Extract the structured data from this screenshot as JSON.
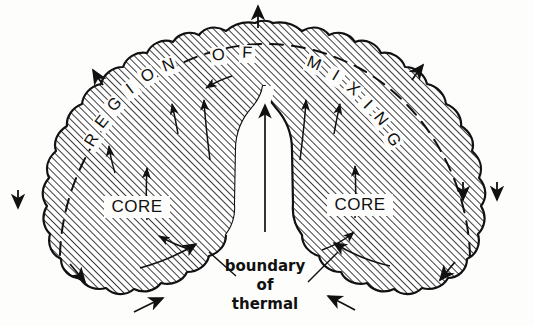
{
  "figure": {
    "kind": "scientific-line-diagram",
    "background_color": "#fdfdfb",
    "ink_color": "#111111",
    "hatch_color": "#1a1a1a"
  },
  "arc_label": {
    "full_text": "REGION OF MIXING",
    "letters": [
      {
        "ch": "R",
        "x": 96,
        "y": 143,
        "rot": -58
      },
      {
        "ch": "E",
        "x": 106,
        "y": 125,
        "rot": -52
      },
      {
        "ch": "G",
        "x": 118,
        "y": 108,
        "rot": -45
      },
      {
        "ch": "I",
        "x": 133,
        "y": 93,
        "rot": -37
      },
      {
        "ch": "O",
        "x": 150,
        "y": 80,
        "rot": -29
      },
      {
        "ch": "N",
        "x": 170,
        "y": 70,
        "rot": -20
      },
      {
        "ch": "O",
        "x": 219,
        "y": 60,
        "rot": -6
      },
      {
        "ch": "F",
        "x": 247,
        "y": 58,
        "rot": 2
      },
      {
        "ch": "M",
        "x": 312,
        "y": 68,
        "rot": 22
      },
      {
        "ch": "I",
        "x": 333,
        "y": 80,
        "rot": 31
      },
      {
        "ch": "X",
        "x": 350,
        "y": 93,
        "rot": 38
      },
      {
        "ch": "I",
        "x": 364,
        "y": 108,
        "rot": 45
      },
      {
        "ch": "N",
        "x": 377,
        "y": 122,
        "rot": 52
      },
      {
        "ch": "G",
        "x": 389,
        "y": 142,
        "rot": 60
      }
    ]
  },
  "core_labels": [
    {
      "text": "CORE",
      "x": 137,
      "y": 212
    },
    {
      "text": "CORE",
      "x": 360,
      "y": 210
    }
  ],
  "caption": {
    "lines": [
      "boundary",
      "of",
      "thermal"
    ],
    "x": 265,
    "y_start": 271,
    "line_height": 19
  },
  "annotations": {
    "dashed_boundary_name": "boundary of mixing region",
    "internal_flow": "upward core flow",
    "external_flow": "entrained ambient air"
  }
}
